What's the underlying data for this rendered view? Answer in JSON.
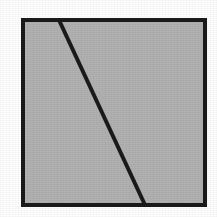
{
  "figure": {
    "background_color": "#fefefe",
    "canvas": {
      "width": 217,
      "height": 217
    }
  },
  "chart_data": {
    "type": "diagram",
    "xlabel": "",
    "ylabel": "",
    "xlim": [
      0,
      217
    ],
    "ylim": [
      0,
      217
    ],
    "grid": false,
    "legend": "none",
    "shapes": [
      {
        "name": "outer-square",
        "kind": "rectangle",
        "x": 23,
        "y": 20,
        "width": 182,
        "height": 185,
        "fill_color": "#b1b1b1",
        "stroke_color": "#1a1a1a",
        "stroke_width": 4
      },
      {
        "name": "diagonal-divider",
        "kind": "line",
        "x1": 59,
        "y1": 20,
        "x2": 145,
        "y2": 205,
        "stroke_color": "#1a1a1a",
        "stroke_width": 4
      }
    ],
    "regions": [
      {
        "name": "left-region",
        "vertices": [
          [
            23,
            20
          ],
          [
            59,
            20
          ],
          [
            145,
            205
          ],
          [
            23,
            205
          ]
        ],
        "fill_color": "#b1b1b1"
      },
      {
        "name": "right-region",
        "vertices": [
          [
            59,
            20
          ],
          [
            205,
            20
          ],
          [
            205,
            205
          ],
          [
            145,
            205
          ]
        ],
        "fill_color": "#b1b1b1"
      }
    ],
    "colors": {
      "fill": "#b1b1b1",
      "stroke": "#1a1a1a",
      "page": "#ffffff"
    }
  }
}
